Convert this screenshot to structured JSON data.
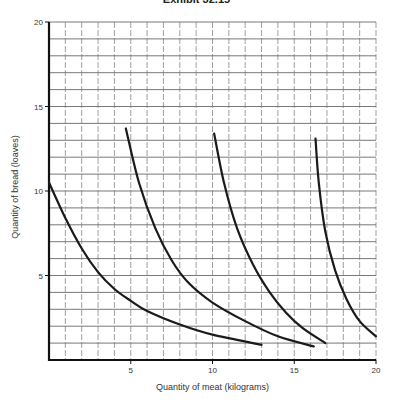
{
  "chart_data": {
    "type": "line",
    "title": "Exhibit 32.15",
    "xlabel": "Quantity of meat (kilograms)",
    "ylabel": "Quantity of bread (loaves)",
    "xlim": [
      0,
      20
    ],
    "ylim": [
      0,
      20
    ],
    "xticks": [
      5,
      10,
      15,
      20
    ],
    "yticks": [
      5,
      10,
      15,
      20
    ],
    "grid": true,
    "legend": null,
    "series": [
      {
        "name": "Curve 1",
        "x": [
          0,
          1,
          2,
          3,
          4,
          5,
          6,
          8,
          10,
          13
        ],
        "y": [
          10.5,
          8.4,
          6.6,
          5.2,
          4.2,
          3.5,
          2.9,
          2.1,
          1.5,
          0.9
        ]
      },
      {
        "name": "Curve 2",
        "x": [
          4.7,
          5.5,
          6.5,
          7.5,
          8.5,
          10,
          12,
          14,
          16.2
        ],
        "y": [
          13.7,
          10.5,
          7.8,
          5.9,
          4.6,
          3.4,
          2.3,
          1.4,
          0.8
        ]
      },
      {
        "name": "Curve 3",
        "x": [
          10.1,
          10.7,
          11.5,
          12.5,
          13.5,
          14.5,
          15.5,
          16.9
        ],
        "y": [
          13.4,
          10.5,
          7.8,
          5.6,
          4.0,
          2.8,
          1.9,
          1.0
        ]
      },
      {
        "name": "Curve 4",
        "x": [
          16.3,
          16.5,
          16.9,
          17.5,
          18.2,
          19.0,
          20.0
        ],
        "y": [
          13.1,
          10.5,
          7.6,
          5.3,
          3.6,
          2.3,
          1.4
        ]
      }
    ]
  },
  "labels": {
    "title": "Exhibit 32.15",
    "xlabel": "Quantity of meat (kilograms)",
    "ylabel": "Quantity of bread (loaves)"
  }
}
